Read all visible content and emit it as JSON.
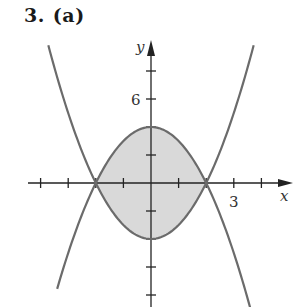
{
  "header": {
    "problem_number": "3.",
    "part_label": "(a)"
  },
  "chart_data": {
    "type": "area",
    "xlabel": "x",
    "ylabel": "y",
    "xlim": [
      -4.0,
      4.0
    ],
    "ylim": [
      -8.8,
      10.3
    ],
    "x_ticks": [
      -4,
      -3,
      -2,
      -1,
      1,
      2,
      3,
      4
    ],
    "x_tick_labels": {
      "3": "3"
    },
    "y_ticks": [
      -8,
      -6,
      -4,
      -2,
      2,
      4,
      6,
      8
    ],
    "y_tick_labels": {
      "6": "6"
    },
    "grid": false,
    "series": [
      {
        "name": "y = x^2 - 4",
        "equation": "x^2-4",
        "color": "#6b6b6b",
        "x_range": [
          -3.72,
          3.72
        ]
      },
      {
        "name": "y = 4 - x^2",
        "equation": "4-x^2",
        "color": "#6b6b6b",
        "x_range": [
          -3.4,
          3.6
        ]
      }
    ],
    "shaded_region": {
      "between": [
        "4-x^2",
        "x^2-4"
      ],
      "x_range": [
        -2,
        2
      ],
      "fill": "#d9d9d9"
    },
    "intersections": [
      [
        -2,
        0
      ],
      [
        2,
        0
      ]
    ],
    "axis_color": "#222222"
  }
}
